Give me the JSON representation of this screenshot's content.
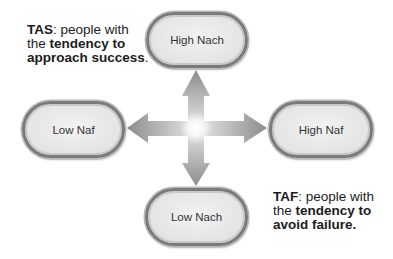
{
  "captions": {
    "tas": {
      "term": "TAS",
      "line1_rest": ": people with",
      "line2_pre": "the ",
      "line2_bold": "tendency to",
      "line3_bold": "approach success",
      "line3_rest": "."
    },
    "taf": {
      "term": "TAF",
      "line1_rest": ": people with",
      "line2_pre": "the ",
      "line2_bold": "tendency to",
      "line3_bold": "avoid failure."
    }
  },
  "nodes": {
    "top": {
      "label": "High Nach"
    },
    "left": {
      "label": "Low Naf"
    },
    "right": {
      "label": "High Naf"
    },
    "bottom": {
      "label": "Low Nach"
    }
  },
  "arrows": {
    "directions": [
      "up",
      "down",
      "left",
      "right"
    ],
    "center_glow_color": "#ffffff",
    "arrow_color": "#9a9a9a"
  }
}
